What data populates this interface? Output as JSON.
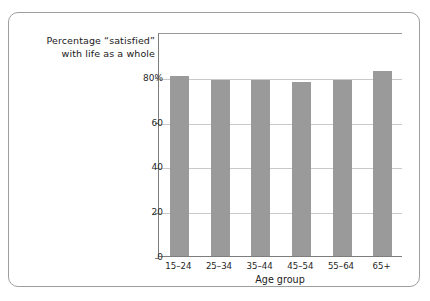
{
  "chart_data": {
    "type": "bar",
    "title": "Percentage “satisfied” with life as a whole",
    "title_lines": [
      "Percentage “satisfied”",
      "with life as a whole"
    ],
    "categories": [
      "15–24",
      "25–34",
      "35–44",
      "45–54",
      "55–64",
      "65+"
    ],
    "values": [
      81,
      79,
      79,
      78,
      79,
      83
    ],
    "xlabel": "Age group",
    "ylabel": "",
    "ylim": [
      0,
      100
    ],
    "yticks": [
      0,
      20,
      40,
      60,
      80
    ],
    "ytick_labels": [
      "0",
      "20",
      "40",
      "60",
      "80%"
    ],
    "grid": true,
    "legend": "none",
    "bar_color": "#9a9a9a",
    "gridline_color": "#c9c9c9",
    "axis_color": "#7d7d7d",
    "border_color": "#9e9e9e"
  }
}
